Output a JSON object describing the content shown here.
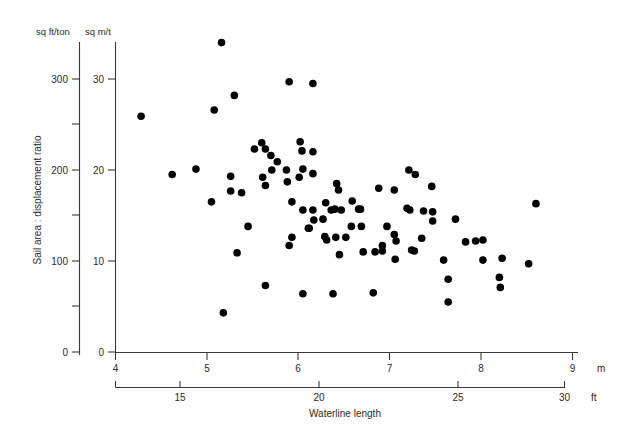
{
  "chart_data": {
    "type": "scatter",
    "title": "",
    "xlabel": "Waterline length",
    "ylabel": "Sail area : displacement ratio",
    "x_primary_unit": "m",
    "x_secondary_unit": "ft",
    "y_primary_unit": "sq m/t",
    "y_secondary_unit": "sq ft/ton",
    "xlim": [
      4,
      9.2
    ],
    "ylim": [
      0,
      35
    ],
    "x_ticks_m": [
      4,
      5,
      6,
      7,
      8,
      9
    ],
    "x_ticks_ft": [
      15,
      20,
      25,
      30
    ],
    "y_ticks_sqmt": [
      0,
      10,
      20,
      30
    ],
    "y_ticks_sqftton": [
      0,
      100,
      200,
      300
    ],
    "y_minor_ticks_sqftton": [
      50,
      150,
      250
    ],
    "grid": false,
    "legend": "none",
    "marker_color": "#000000",
    "marker_size_px": 5.4,
    "points_m_sqmt": [
      [
        5.16,
        34.0
      ],
      [
        4.28,
        25.9
      ],
      [
        5.08,
        26.6
      ],
      [
        5.3,
        28.2
      ],
      [
        5.9,
        29.7
      ],
      [
        6.16,
        29.5
      ],
      [
        4.62,
        19.5
      ],
      [
        4.88,
        20.1
      ],
      [
        5.6,
        23.0
      ],
      [
        5.52,
        22.3
      ],
      [
        5.64,
        22.3
      ],
      [
        5.7,
        21.6
      ],
      [
        5.77,
        20.9
      ],
      [
        6.02,
        23.1
      ],
      [
        6.04,
        22.1
      ],
      [
        5.71,
        20.0
      ],
      [
        5.87,
        20.0
      ],
      [
        6.16,
        22.0
      ],
      [
        5.61,
        19.2
      ],
      [
        5.64,
        18.3
      ],
      [
        6.01,
        19.2
      ],
      [
        5.05,
        16.5
      ],
      [
        5.26,
        19.3
      ],
      [
        5.26,
        17.7
      ],
      [
        5.38,
        17.5
      ],
      [
        5.93,
        16.5
      ],
      [
        6.44,
        17.8
      ],
      [
        6.3,
        16.4
      ],
      [
        6.05,
        15.6
      ],
      [
        6.16,
        15.6
      ],
      [
        6.36,
        15.6
      ],
      [
        6.68,
        15.7
      ],
      [
        6.88,
        18.0
      ],
      [
        6.59,
        16.6
      ],
      [
        6.4,
        15.7
      ],
      [
        6.17,
        14.5
      ],
      [
        6.27,
        14.6
      ],
      [
        6.47,
        15.6
      ],
      [
        6.66,
        15.7
      ],
      [
        6.11,
        13.6
      ],
      [
        6.12,
        13.6
      ],
      [
        6.58,
        13.8
      ],
      [
        6.69,
        13.8
      ],
      [
        6.97,
        13.8
      ],
      [
        5.93,
        12.6
      ],
      [
        6.29,
        12.7
      ],
      [
        6.31,
        12.3
      ],
      [
        6.41,
        12.6
      ],
      [
        6.52,
        12.6
      ],
      [
        6.92,
        11.7
      ],
      [
        5.9,
        11.7
      ],
      [
        6.84,
        11.0
      ],
      [
        6.45,
        10.7
      ],
      [
        6.71,
        11.0
      ],
      [
        6.92,
        11.1
      ],
      [
        7.27,
        11.1
      ],
      [
        7.21,
        20.0
      ],
      [
        7.28,
        19.5
      ],
      [
        7.46,
        18.2
      ],
      [
        7.05,
        17.8
      ],
      [
        7.19,
        15.8
      ],
      [
        7.22,
        15.6
      ],
      [
        7.37,
        15.5
      ],
      [
        7.47,
        15.4
      ],
      [
        7.47,
        14.4
      ],
      [
        7.72,
        14.6
      ],
      [
        7.05,
        12.9
      ],
      [
        7.35,
        12.5
      ],
      [
        7.07,
        12.2
      ],
      [
        7.83,
        12.1
      ],
      [
        7.94,
        12.2
      ],
      [
        8.02,
        12.3
      ],
      [
        7.24,
        11.2
      ],
      [
        7.59,
        10.1
      ],
      [
        8.02,
        10.1
      ],
      [
        8.23,
        10.3
      ],
      [
        7.06,
        10.2
      ],
      [
        7.64,
        8.0
      ],
      [
        8.2,
        8.2
      ],
      [
        8.52,
        9.7
      ],
      [
        8.21,
        7.1
      ],
      [
        8.6,
        16.3
      ],
      [
        5.18,
        4.3
      ],
      [
        5.64,
        7.3
      ],
      [
        6.05,
        6.4
      ],
      [
        6.38,
        6.4
      ],
      [
        6.82,
        6.5
      ],
      [
        7.64,
        5.5
      ],
      [
        5.45,
        13.8
      ],
      [
        5.33,
        10.9
      ],
      [
        6.05,
        20.1
      ],
      [
        6.16,
        19.6
      ],
      [
        5.88,
        18.7
      ],
      [
        6.42,
        18.5
      ]
    ]
  },
  "labels": {
    "y_unit_left": "sq ft/ton",
    "y_unit_right": "sq m/t",
    "x_unit_m": "m",
    "x_unit_ft": "ft",
    "y_axis_title": "Sail area : displacement ratio",
    "x_axis_title": "Waterline length",
    "y_ft_0": "0",
    "y_ft_100": "100",
    "y_ft_200": "200",
    "y_ft_300": "300",
    "y_m_0": "0",
    "y_m_10": "10",
    "y_m_20": "20",
    "y_m_30": "30",
    "x_m_4": "4",
    "x_m_5": "5",
    "x_m_6": "6",
    "x_m_7": "7",
    "x_m_8": "8",
    "x_m_9": "9",
    "x_ft_15": "15",
    "x_ft_20": "20",
    "x_ft_25": "25",
    "x_ft_30": "30"
  }
}
